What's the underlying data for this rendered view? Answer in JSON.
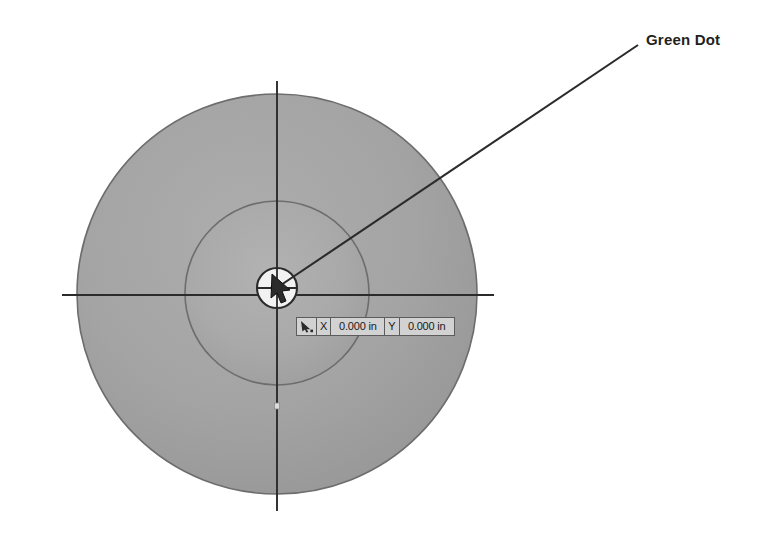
{
  "scene": {
    "title": "Sketch view with green dot origin callout",
    "background_color": "#ffffff"
  },
  "annotation": {
    "label": "Green Dot",
    "leader_line": {
      "from_x": 638,
      "from_y": 45,
      "to_x": 281,
      "to_y": 285,
      "color": "#2b2b2b"
    }
  },
  "geometry": {
    "outer_circle": {
      "name": "outer-circle",
      "center_x": 277,
      "center_y": 294,
      "radius": 200,
      "fill": "#a0a0a0",
      "stroke": "#6d6d6d"
    },
    "inner_circle": {
      "name": "inner-circle",
      "center_x": 277,
      "center_y": 293,
      "radius": 92,
      "fill": "#a9a9a9",
      "stroke": "#6d6d6d"
    },
    "origin_marker": {
      "name": "origin-circle",
      "center_x": 277,
      "center_y": 288,
      "radius": 20,
      "fill": "#f2f2f2",
      "stroke": "#2b2b2b"
    },
    "green_dot": {
      "name": "green-dot",
      "center_x": 277,
      "center_y": 288,
      "radius": 5,
      "fill": "#6f6f6f",
      "stroke": "#2b2b2b"
    },
    "centerline_horizontal": {
      "x1": 62,
      "y1": 295,
      "x2": 494,
      "y2": 295,
      "color": "#2b2b2b"
    },
    "centerline_vertical": {
      "x1": 277,
      "y1": 81,
      "x2": 277,
      "y2": 511,
      "color": "#2b2b2b"
    },
    "point_marker": {
      "name": "sketch-point-marker",
      "x": 277,
      "y": 406,
      "size": 5,
      "fill": "#dcdcdc",
      "stroke": "#8a8a8a"
    }
  },
  "coord_readout": {
    "cursor_icon": "cursor-arrow-icon",
    "x_axis_label": "X",
    "x_value": "0.000 in",
    "y_axis_label": "Y",
    "y_value": "0.000 in"
  }
}
